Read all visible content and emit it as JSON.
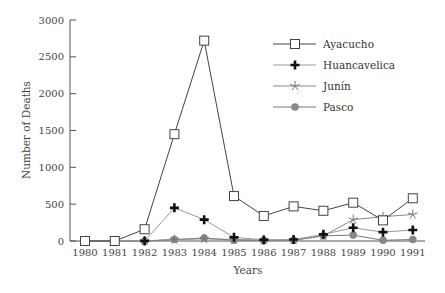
{
  "chart_data": {
    "type": "line",
    "title": "",
    "xlabel": "Years",
    "ylabel": "Number of Deaths",
    "ylim": [
      0,
      3000
    ],
    "yticks": [
      0,
      500,
      1000,
      1500,
      2000,
      2500,
      3000
    ],
    "grid": false,
    "legend_position": "upper right",
    "x": [
      "1980",
      "1981",
      "1982",
      "1983",
      "1984",
      "1985",
      "1986",
      "1987",
      "1988",
      "1989",
      "1990",
      "1991"
    ],
    "series": [
      {
        "name": "Ayacucho",
        "marker": "open-square",
        "color": "#444444",
        "values": [
          0,
          0,
          160,
          1450,
          2720,
          610,
          340,
          470,
          410,
          520,
          280,
          580
        ]
      },
      {
        "name": "Huancavelica",
        "marker": "plus",
        "color": "#999999",
        "values": [
          0,
          0,
          0,
          450,
          290,
          50,
          15,
          20,
          90,
          180,
          120,
          150
        ]
      },
      {
        "name": "Junín",
        "marker": "star",
        "color": "#888888",
        "values": [
          0,
          0,
          0,
          20,
          30,
          20,
          10,
          10,
          70,
          290,
          330,
          360
        ]
      },
      {
        "name": "Pasco",
        "marker": "filled-circle",
        "color": "#777777",
        "values": [
          0,
          0,
          0,
          20,
          40,
          10,
          10,
          10,
          70,
          80,
          10,
          20
        ]
      }
    ]
  }
}
